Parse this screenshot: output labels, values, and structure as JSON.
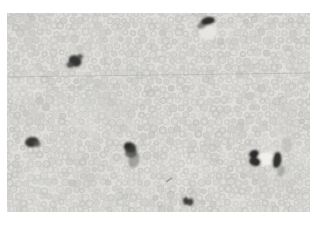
{
  "scene": {
    "type": "micrograph",
    "description": "Light micrograph: dense field of pale round cells with scattered darkly stained (immunopositive) cells; faint horizontal scratch line; white border around photo",
    "canvas": {
      "width": 318,
      "height": 226,
      "background": "#ffffff"
    },
    "photo": {
      "x": 7,
      "y": 13,
      "width": 303,
      "height": 199,
      "background": "#dfdedb"
    },
    "texture": {
      "seed": 1337,
      "cell_spacing_x": 7.6,
      "cell_spacing_y": 6.8,
      "cell_radius_min": 2.6,
      "cell_radius_max": 4.1,
      "cell_fills": [
        "#c6c6c3",
        "#cccbc8",
        "#d1d0cd",
        "#c9c8c5",
        "#c0c0bd"
      ],
      "cell_stroke": "#b9b9b6",
      "cell_inner_highlight": "#e6e5e2",
      "patch_light": "#edece9",
      "patch_dark": "#c2c2bf",
      "patch_count": 16
    },
    "artifacts": [
      {
        "kind": "scratch-line",
        "x1": 0,
        "y1": 64,
        "x2": 303,
        "y2": 60,
        "color": "#a8a8a5",
        "width": 0.8,
        "opacity": 0.6
      },
      {
        "kind": "scratch-line",
        "x1": 0,
        "y1": 75,
        "x2": 120,
        "y2": 74,
        "color": "#b5b5b2",
        "width": 0.7,
        "opacity": 0.28
      },
      {
        "kind": "scratch-line",
        "x1": 224,
        "y1": 77,
        "x2": 209,
        "y2": 107,
        "color": "#a5a5a2",
        "width": 0.7,
        "opacity": 0.22
      },
      {
        "kind": "speck",
        "x1": 159,
        "y1": 169,
        "x2": 165,
        "y2": 165,
        "color": "#6a6a68",
        "width": 1.2,
        "opacity": 0.6
      }
    ],
    "stained_cells": [
      {
        "name": "top-center-stained-cell",
        "parts": [
          {
            "cx": 201,
            "cy": 19,
            "rx": 9,
            "ry": 8,
            "rot": 0,
            "fill": "#e9e8e5",
            "opacity": 0.9
          },
          {
            "cx": 195,
            "cy": 12,
            "rx": 5,
            "ry": 3.5,
            "rot": -30,
            "fill": "#6f6f6d",
            "opacity": 0.8
          },
          {
            "cx": 201,
            "cy": 8,
            "rx": 7,
            "ry": 4,
            "rot": -12,
            "fill": "#2e2e2e",
            "opacity": 1
          }
        ]
      },
      {
        "name": "upper-left-stained-cell",
        "parts": [
          {
            "cx": 68,
            "cy": 48,
            "rx": 6.5,
            "ry": 5.5,
            "rot": 25,
            "fill": "#353534",
            "opacity": 1
          },
          {
            "cx": 63,
            "cy": 52,
            "rx": 3.5,
            "ry": 3,
            "rot": 0,
            "fill": "#4b4b4a",
            "opacity": 0.9
          },
          {
            "cx": 73,
            "cy": 43.5,
            "rx": 3,
            "ry": 2.5,
            "rot": 0,
            "fill": "#4b4b4a",
            "opacity": 0.85
          }
        ]
      },
      {
        "name": "lower-left-stained-cell",
        "parts": [
          {
            "cx": 25,
            "cy": 129,
            "rx": 7,
            "ry": 5,
            "rot": -8,
            "fill": "#373736",
            "opacity": 1
          },
          {
            "cx": 30,
            "cy": 131,
            "rx": 3.5,
            "ry": 3,
            "rot": 0,
            "fill": "#5a5a58",
            "opacity": 0.8
          }
        ]
      },
      {
        "name": "center-stained-cell",
        "parts": [
          {
            "cx": 127,
            "cy": 147,
            "rx": 5.5,
            "ry": 8,
            "rot": 15,
            "fill": "#7e7e7b",
            "opacity": 0.6
          },
          {
            "cx": 124,
            "cy": 140,
            "rx": 6,
            "ry": 5,
            "rot": 0,
            "fill": "#565654",
            "opacity": 0.85
          },
          {
            "cx": 123,
            "cy": 134.5,
            "rx": 6.5,
            "ry": 5,
            "rot": 28,
            "fill": "#3a3a39",
            "opacity": 1
          },
          {
            "cx": 121,
            "cy": 133,
            "rx": 3.5,
            "ry": 3,
            "rot": 0,
            "fill": "#2c2c2b",
            "opacity": 1
          }
        ]
      },
      {
        "name": "right-stained-cell-pair",
        "parts": [
          {
            "cx": 259,
            "cy": 146,
            "rx": 8.5,
            "ry": 7,
            "rot": -10,
            "fill": "#f1f0ed",
            "opacity": 0.95
          },
          {
            "cx": 247,
            "cy": 141,
            "rx": 5,
            "ry": 4,
            "rot": -20,
            "fill": "#2b2b2a",
            "opacity": 1
          },
          {
            "cx": 248,
            "cy": 148.5,
            "rx": 6,
            "ry": 4.5,
            "rot": 15,
            "fill": "#2f2f2e",
            "opacity": 1
          },
          {
            "cx": 270,
            "cy": 147,
            "rx": 4.5,
            "ry": 8,
            "rot": 8,
            "fill": "#323231",
            "opacity": 1
          },
          {
            "cx": 274,
            "cy": 158,
            "rx": 3.5,
            "ry": 6,
            "rot": 15,
            "fill": "#8f8f8c",
            "opacity": 0.6
          }
        ]
      },
      {
        "name": "bottom-center-stained-cell",
        "parts": [
          {
            "cx": 179,
            "cy": 188,
            "rx": 2.8,
            "ry": 3.8,
            "rot": -10,
            "fill": "#3b3b3a",
            "opacity": 1
          },
          {
            "cx": 183.5,
            "cy": 189,
            "rx": 2.8,
            "ry": 3.8,
            "rot": 10,
            "fill": "#434342",
            "opacity": 1
          }
        ]
      },
      {
        "name": "right-edge-faint-cell",
        "parts": [
          {
            "cx": 280,
            "cy": 132,
            "rx": 5.5,
            "ry": 8,
            "rot": 0,
            "fill": "#b3b3b0",
            "opacity": 0.5
          }
        ]
      }
    ]
  }
}
